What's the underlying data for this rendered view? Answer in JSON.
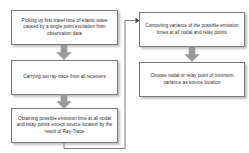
{
  "diagram": {
    "background_color": "#ffffff",
    "box_border_color": "#7a7a7a",
    "text_color": "#2b2b2b",
    "arrow_fill_color": "#9a9a9a",
    "connector_color": "#6e6e6e",
    "nodes": [
      {
        "id": "pick",
        "label": "Picking up first travel time of elastic wave caused by a single point excitation from observation data",
        "column": "left",
        "order": 1
      },
      {
        "id": "ray",
        "label": "Carrying out ray-trace from all receivers",
        "column": "left",
        "order": 2
      },
      {
        "id": "emit",
        "label": "Obtaining possible emission time at all nodal and relay points except source location by the result of Ray-Trace",
        "column": "left",
        "order": 3
      },
      {
        "id": "var",
        "label": "Computing variance of the possible emission times at all nodal and relay points",
        "column": "right",
        "order": 4
      },
      {
        "id": "choose",
        "label": "Choose nodal or relay point of minimum variance as source location",
        "column": "right",
        "order": 5
      }
    ],
    "connectors": [
      {
        "id": "pick-ray",
        "from": "pick",
        "to": "ray",
        "kind": "block-arrow-down"
      },
      {
        "id": "ray-emit",
        "from": "ray",
        "to": "emit",
        "kind": "block-arrow-down"
      },
      {
        "id": "emit-var",
        "from": "emit",
        "to": "var",
        "kind": "elbow-line-arrow-right"
      },
      {
        "id": "var-choose",
        "from": "var",
        "to": "choose",
        "kind": "block-arrow-down"
      }
    ]
  }
}
